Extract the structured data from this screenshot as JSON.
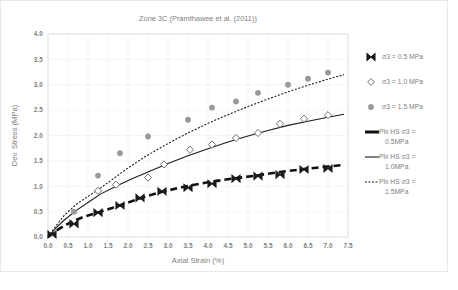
{
  "chart_data": {
    "type": "scatter",
    "title": "Zone 3C (Pramthawee et al. (2011))",
    "xlabel": "Axial Strain (%)",
    "ylabel": "Dev. Stress (MPa)",
    "xlim": [
      0.0,
      7.5
    ],
    "ylim": [
      0.0,
      4.0
    ],
    "xticks": [
      "0.0",
      "0.5",
      "1.0",
      "1.5",
      "2.0",
      "2.5",
      "3.0",
      "3.5",
      "4.0",
      "4.5",
      "5.0",
      "5.5",
      "6.0",
      "6.5",
      "7.0",
      "7.5"
    ],
    "yticks": [
      "0.0",
      "0.5",
      "1.0",
      "1.5",
      "2.0",
      "2.5",
      "3.0",
      "3.5",
      "4.0"
    ],
    "grid": true,
    "legend_position": "right",
    "series": [
      {
        "name": "σ3 = 0.5 MPa",
        "kind": "markers",
        "marker": "bowtie-x-filled",
        "color": "#1a1a1a",
        "points": [
          [
            0.1,
            0.05
          ],
          [
            0.65,
            0.26
          ],
          [
            1.25,
            0.48
          ],
          [
            1.8,
            0.62
          ],
          [
            2.3,
            0.77
          ],
          [
            2.85,
            0.9
          ],
          [
            3.5,
            0.97
          ],
          [
            4.1,
            1.05
          ],
          [
            4.7,
            1.15
          ],
          [
            5.25,
            1.2
          ],
          [
            5.8,
            1.23
          ],
          [
            6.4,
            1.33
          ],
          [
            7.0,
            1.35
          ]
        ]
      },
      {
        "name": "σ3 = 1.0 MPa",
        "kind": "markers",
        "marker": "diamond-open",
        "color": "#8c8c8c",
        "points": [
          [
            1.25,
            0.91
          ],
          [
            1.7,
            1.03
          ],
          [
            2.5,
            1.17
          ],
          [
            2.9,
            1.43
          ],
          [
            3.55,
            1.72
          ],
          [
            4.1,
            1.82
          ],
          [
            4.7,
            1.95
          ],
          [
            5.25,
            2.05
          ],
          [
            5.8,
            2.23
          ],
          [
            6.4,
            2.33
          ],
          [
            7.0,
            2.4
          ]
        ]
      },
      {
        "name": "σ3 = 1.5 MPa",
        "kind": "markers",
        "marker": "circle-filled",
        "color": "#999999",
        "points": [
          [
            0.65,
            0.5
          ],
          [
            1.25,
            1.21
          ],
          [
            1.8,
            1.65
          ],
          [
            2.5,
            1.98
          ],
          [
            3.5,
            2.31
          ],
          [
            4.1,
            2.55
          ],
          [
            4.7,
            2.67
          ],
          [
            5.25,
            2.84
          ],
          [
            6.0,
            3.0
          ],
          [
            6.5,
            3.12
          ],
          [
            7.0,
            3.24
          ]
        ]
      },
      {
        "name": "Plx HS σ3 = 0.5MPa",
        "kind": "line",
        "style": "thick-dashed",
        "color": "#111111",
        "points": [
          [
            0.0,
            0.0
          ],
          [
            0.2,
            0.12
          ],
          [
            0.4,
            0.22
          ],
          [
            0.6,
            0.3
          ],
          [
            0.9,
            0.4
          ],
          [
            1.2,
            0.47
          ],
          [
            1.6,
            0.57
          ],
          [
            2.0,
            0.68
          ],
          [
            2.4,
            0.79
          ],
          [
            2.9,
            0.9
          ],
          [
            3.4,
            0.99
          ],
          [
            4.0,
            1.08
          ],
          [
            4.6,
            1.15
          ],
          [
            5.2,
            1.21
          ],
          [
            5.8,
            1.28
          ],
          [
            6.4,
            1.34
          ],
          [
            7.0,
            1.39
          ],
          [
            7.4,
            1.42
          ]
        ]
      },
      {
        "name": "Plx HS σ3 = 1.0MPa",
        "kind": "line",
        "style": "thin-solid",
        "color": "#1a1a1a",
        "points": [
          [
            0.0,
            0.0
          ],
          [
            0.2,
            0.18
          ],
          [
            0.4,
            0.33
          ],
          [
            0.7,
            0.52
          ],
          [
            1.0,
            0.68
          ],
          [
            1.3,
            0.84
          ],
          [
            1.7,
            1.0
          ],
          [
            2.1,
            1.15
          ],
          [
            2.5,
            1.28
          ],
          [
            3.0,
            1.45
          ],
          [
            3.5,
            1.6
          ],
          [
            4.0,
            1.74
          ],
          [
            4.5,
            1.87
          ],
          [
            5.0,
            1.99
          ],
          [
            5.5,
            2.1
          ],
          [
            6.0,
            2.2
          ],
          [
            6.5,
            2.28
          ],
          [
            7.0,
            2.36
          ],
          [
            7.4,
            2.42
          ]
        ]
      },
      {
        "name": "Plx HS σ3 = 1.5MPa",
        "kind": "line",
        "style": "fine-dotted",
        "color": "#1a1a1a",
        "points": [
          [
            0.0,
            0.0
          ],
          [
            0.2,
            0.22
          ],
          [
            0.4,
            0.42
          ],
          [
            0.7,
            0.64
          ],
          [
            1.0,
            0.8
          ],
          [
            1.25,
            0.93
          ],
          [
            1.6,
            1.13
          ],
          [
            2.0,
            1.36
          ],
          [
            2.4,
            1.57
          ],
          [
            2.9,
            1.8
          ],
          [
            3.4,
            2.01
          ],
          [
            4.0,
            2.24
          ],
          [
            4.5,
            2.41
          ],
          [
            5.0,
            2.57
          ],
          [
            5.5,
            2.72
          ],
          [
            6.0,
            2.86
          ],
          [
            6.5,
            2.99
          ],
          [
            7.0,
            3.11
          ],
          [
            7.4,
            3.2
          ]
        ]
      }
    ],
    "legend_entries": [
      {
        "label": "σ3 = 0.5 MPa",
        "sample": "bowtie-x-filled"
      },
      {
        "label": "σ3 = 1.0 MPa",
        "sample": "diamond-open"
      },
      {
        "label": "σ3 = 1.5 MPa",
        "sample": "circle-filled"
      },
      {
        "label_line1": "Plx HS σ3 =",
        "label_line2": "0.5MPa",
        "sample": "thick-dashed"
      },
      {
        "label_line1": "Plx HS σ3 =",
        "label_line2": "1.0MPa",
        "sample": "thin-solid"
      },
      {
        "label_line1": "Plx HS σ3 =",
        "label_line2": "1.5MPa",
        "sample": "fine-dotted"
      }
    ]
  }
}
